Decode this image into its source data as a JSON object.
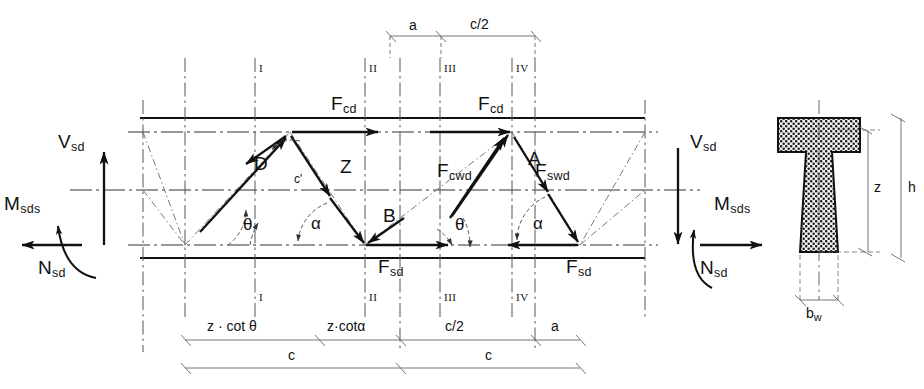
{
  "diagram": {
    "type": "structural-engineering-truss-diagram"
  },
  "forces": {
    "top_chord_left": "F",
    "top_chord_left_sub": "cd",
    "top_chord_right": "F",
    "top_chord_right_sub": "cd",
    "bottom_chord_left": "F",
    "bottom_chord_left_sub": "sd",
    "bottom_chord_right": "F",
    "bottom_chord_right_sub": "sd",
    "concrete_strut_web": "F",
    "concrete_strut_web_sub": "cwd",
    "stirrup_force": "F",
    "stirrup_force_sub": "swd"
  },
  "support_actions": {
    "left": {
      "shear": "V",
      "shear_sub": "sd",
      "moment": "M",
      "moment_sub": "sds",
      "normal": "N",
      "normal_sub": "sd"
    },
    "right": {
      "shear": "V",
      "shear_sub": "sd",
      "moment": "M",
      "moment_sub": "sds",
      "normal": "N",
      "normal_sub": "sd"
    }
  },
  "nodes": {
    "d": "D",
    "z": "Z",
    "b": "B",
    "a": "A",
    "c_prime": "c'"
  },
  "angles": {
    "theta_left": "θ",
    "theta_right": "θ",
    "alpha_left": "α",
    "alpha_right": "α"
  },
  "sections": {
    "top": [
      "I",
      "II",
      "III",
      "IV"
    ],
    "bottom": [
      "I",
      "II",
      "III",
      "IV"
    ]
  },
  "dimensions": {
    "top": [
      "a",
      "c/2"
    ],
    "bottom_upper": [
      "z · cot θ",
      "z·cotα",
      "c/2",
      "a"
    ],
    "bottom_lower": [
      "c",
      "c"
    ]
  },
  "cross_section": {
    "height": "h",
    "lever_arm": "z",
    "web_width": "b",
    "web_width_sub": "w"
  },
  "colors": {
    "ink": "#111111",
    "line": "#1a1a1a",
    "thin": "#555555",
    "dashdot": "#3a3a3a",
    "hatch": "#222222",
    "background": "#ffffff"
  }
}
